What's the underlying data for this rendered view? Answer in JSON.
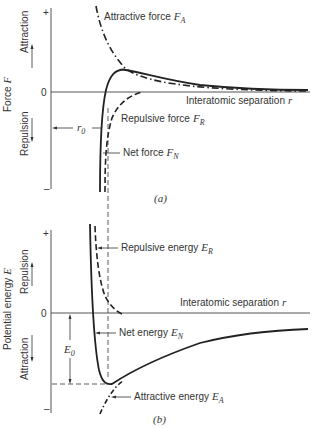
{
  "panel_a": {
    "caption": "(a)",
    "y_axis_label": "Force F",
    "y_axis_label_symbol": "F",
    "y_axis_label_text": "Force",
    "upper_region_label": "Attraction",
    "lower_region_label": "Repulsion",
    "tick_plus": "+",
    "tick_zero": "0",
    "tick_minus": "–",
    "x_axis_label_text": "Interatomic separation",
    "x_axis_label_symbol": "r",
    "r0_label": "r",
    "r0_sub": "0",
    "curves": [
      {
        "name": "Attractive force",
        "symbol": "F",
        "sub": "A",
        "style": "dash-dot"
      },
      {
        "name": "Repulsive force",
        "symbol": "F",
        "sub": "R",
        "style": "dashed"
      },
      {
        "name": "Net force",
        "symbol": "F",
        "sub": "N",
        "style": "solid"
      }
    ]
  },
  "panel_b": {
    "caption": "(b)",
    "y_axis_label_text": "Potential energy",
    "y_axis_label_symbol": "E",
    "upper_region_label": "Repulsion",
    "lower_region_label": "Attraction",
    "tick_plus": "+",
    "tick_zero": "0",
    "tick_minus": "–",
    "x_axis_label_text": "Interatomic separation",
    "x_axis_label_symbol": "r",
    "e0_label": "E",
    "e0_sub": "0",
    "curves": [
      {
        "name": "Repulsive energy",
        "symbol": "E",
        "sub": "R",
        "style": "dashed"
      },
      {
        "name": "Net energy",
        "symbol": "E",
        "sub": "N",
        "style": "solid"
      },
      {
        "name": "Attractive energy",
        "symbol": "E",
        "sub": "A",
        "style": "dotted-dash"
      }
    ]
  },
  "colors": {
    "ink": "#222222",
    "axis": "#555555"
  }
}
